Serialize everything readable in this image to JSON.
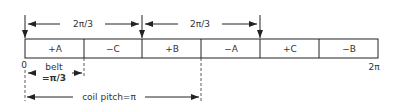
{
  "diagram": {
    "top_spans": [
      {
        "label": "2π/3",
        "x1": 25,
        "x2": 142
      },
      {
        "label": "2π/3",
        "x1": 142,
        "x2": 260
      }
    ],
    "phase_belts": [
      {
        "label": "+A"
      },
      {
        "label": "−C"
      },
      {
        "label": "+B"
      },
      {
        "label": "−A"
      },
      {
        "label": "+C"
      },
      {
        "label": "−B"
      }
    ],
    "origin_label": "0",
    "end_label": "2π",
    "belt_label_line1": "belt",
    "belt_label_line2": "=π/3",
    "coil_pitch_label": "coil pitch=π"
  }
}
